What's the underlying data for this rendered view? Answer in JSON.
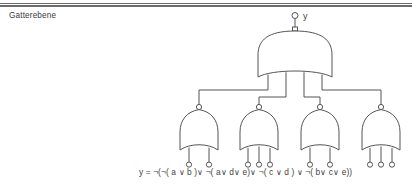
{
  "slide": {
    "title": "Gatterebene",
    "background_color": "#ffffff",
    "rule_color": "#6b6b6b",
    "line_color": "#555555",
    "text_color": "#3f3f3f"
  },
  "circuit": {
    "output_label": "y",
    "output_bubble": "inversion-bubble",
    "top_gate": {
      "name": "nor-gate-output",
      "type": "NOR",
      "inputs": 4,
      "inverted_output": true
    },
    "lower_gates": [
      {
        "name": "nor-gate-1",
        "type": "NOR",
        "inputs": 2,
        "inverted_output": true,
        "input_labels": [
          "a",
          "b"
        ]
      },
      {
        "name": "nor-gate-2",
        "type": "NOR",
        "inputs": 3,
        "inverted_output": true,
        "input_labels": [
          "a",
          "d",
          "e"
        ]
      },
      {
        "name": "nor-gate-3",
        "type": "NOR",
        "inputs": 2,
        "inverted_output": true,
        "input_labels": [
          "c",
          "d"
        ]
      },
      {
        "name": "nor-gate-4",
        "type": "NOR",
        "inputs": 3,
        "inverted_output": true,
        "input_labels": [
          "b",
          "c",
          "e"
        ]
      }
    ],
    "input_bubbles": "inversion-bubble"
  },
  "formula": {
    "text": "y = ¬(¬( a  ∨    b )∨ ¬( a∨ d∨ e)∨  ¬( c  ∨   d ) ∨  ¬( b∨ c∨ e))"
  }
}
